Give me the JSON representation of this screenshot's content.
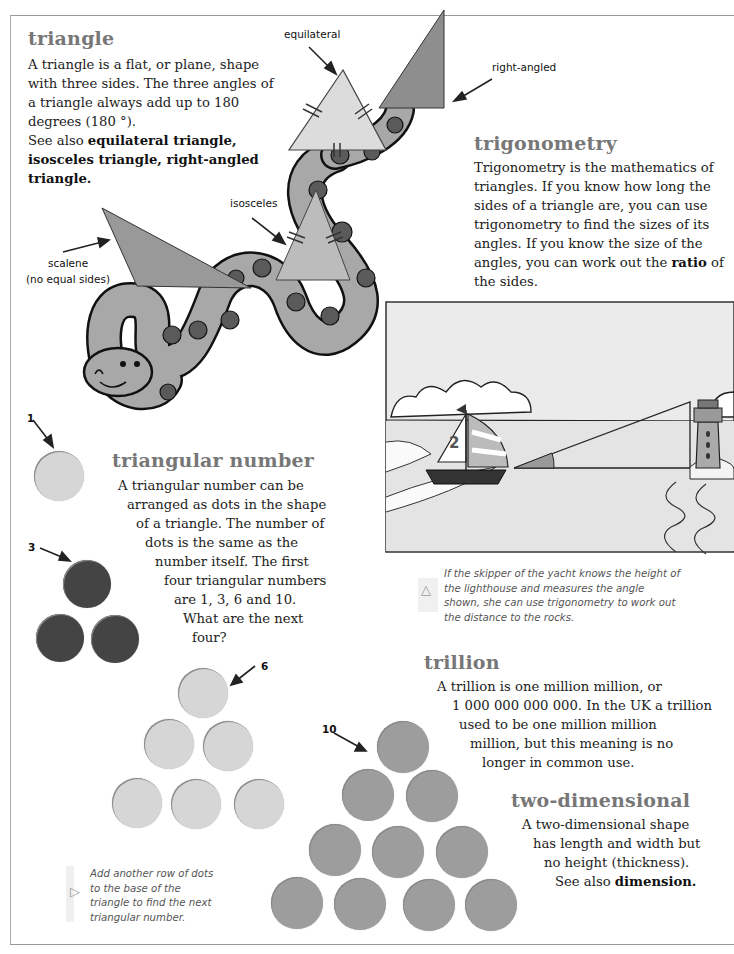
{
  "entries": {
    "triangle": {
      "heading": "triangle",
      "lines": [
        "A triangle is a flat, or plane, shape",
        "with three sides. The three angles of",
        "a triangle always add up to 180",
        "degrees (180 °).",
        "See also "
      ],
      "see_also_bold": [
        "equilateral triangle,",
        "isosceles triangle, right-angled",
        "triangle."
      ]
    },
    "trigonometry": {
      "heading": "trigonometry",
      "lines": [
        "Trigonometry is the mathematics of",
        "triangles. If you know how long the",
        "sides of a triangle are, you can use",
        "trigonometry to find the sizes of its",
        "angles. If you know the size of the",
        "angles, you can work out the ",
        "the sides."
      ],
      "bold_word": "ratio",
      "after_bold": " of"
    },
    "triangular_number": {
      "heading": "triangular number",
      "lines": [
        "A triangular number can be",
        "arranged as dots in the shape",
        "of a triangle. The number of",
        "dots is the same as the",
        "number itself. The first",
        "four triangular numbers",
        "are 1, 3, 6 and 10.",
        "What are the next",
        "four?"
      ]
    },
    "trillion": {
      "heading": "trillion",
      "lines": [
        "A trillion is one million million, or",
        "1 000 000 000 000. In the UK a trillion",
        "used to be one million million",
        "million, but this meaning is no",
        "longer in common use."
      ]
    },
    "two_dimensional": {
      "heading": "two-dimensional",
      "lines": [
        "A two-dimensional shape",
        "has length and width but",
        "no height (thickness).",
        "See also "
      ],
      "bold_word": "dimension."
    }
  },
  "triangle_labels": {
    "equilateral": "equilateral",
    "right_angled": "right-angled",
    "isosceles": "isosceles",
    "scalene_1": "scalene",
    "scalene_2": "(no equal sides)"
  },
  "dot_labels": {
    "one": "1",
    "three": "3",
    "six": "6",
    "ten": "10"
  },
  "captions": {
    "lighthouse": {
      "icon": "triangle-up-icon",
      "lines": [
        "If the skipper of the yacht knows the height of",
        "the lighthouse and measures the angle",
        "shown, she can use trigonometry to work out",
        "the distance to the rocks."
      ]
    },
    "dots": {
      "icon": "triangle-right-icon",
      "lines": [
        "Add another row of dots",
        "to the base of the",
        "triangle to find the next",
        "triangular number."
      ]
    }
  },
  "illustration": {
    "boat_number": "2"
  }
}
